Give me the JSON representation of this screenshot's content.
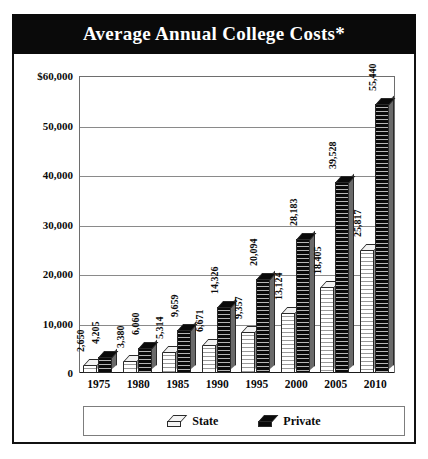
{
  "chart": {
    "title": "Average Annual College Costs*"
  },
  "legend": {
    "items": [
      {
        "label": "State",
        "swatch": "state-swatch-icon",
        "color": "#f4f4f4"
      },
      {
        "label": "Private",
        "swatch": "private-swatch-icon",
        "color": "#0a0a0a"
      }
    ]
  },
  "chart_data": {
    "type": "bar",
    "title": "Average Annual College Costs*",
    "xlabel": "",
    "ylabel": "",
    "categories": [
      "1975",
      "1980",
      "1985",
      "1990",
      "1995",
      "2000",
      "2005",
      "2010"
    ],
    "series": [
      {
        "name": "State",
        "color": "#f4f4f4",
        "values": [
          2650,
          3380,
          5314,
          6671,
          9357,
          13124,
          18405,
          25817
        ],
        "labels": [
          "2,650",
          "3,380",
          "5,314",
          "6,671",
          "9,357",
          "13,124",
          "18,405",
          "25,817"
        ]
      },
      {
        "name": "Private",
        "color": "#0a0a0a",
        "values": [
          4205,
          6060,
          9659,
          14326,
          20094,
          28183,
          39528,
          55440
        ],
        "labels": [
          "4,205",
          "6,060",
          "9,659",
          "14,326",
          "20,094",
          "28,183",
          "39,528",
          "55,440"
        ]
      }
    ],
    "ylim": [
      0,
      60000
    ],
    "ytick_labels": [
      "$60,000",
      "50,000",
      "40,000",
      "30,000",
      "20,000",
      "10,000",
      "0"
    ],
    "ytick_values": [
      60000,
      50000,
      40000,
      30000,
      20000,
      10000,
      0
    ],
    "grid": true,
    "legend_position": "bottom"
  }
}
